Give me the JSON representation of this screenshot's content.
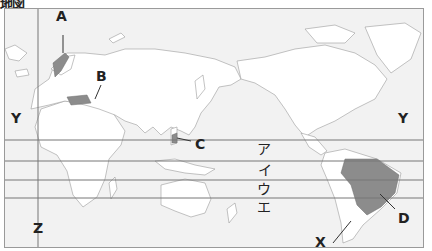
{
  "title": "地図",
  "map": {
    "background_color": "#f2f2f2",
    "land_color": "#ffffff",
    "highlight_color": "#8c8c8c",
    "line_color": "#777777",
    "markers": [
      {
        "id": "A",
        "label": "A",
        "target": "Norway"
      },
      {
        "id": "B",
        "label": "B",
        "target": "Turkey"
      },
      {
        "id": "C",
        "label": "C",
        "target": "Philippines"
      },
      {
        "id": "D",
        "label": "D",
        "target": "Brazil"
      },
      {
        "id": "X",
        "label": "X",
        "target": "Andes / Chile"
      }
    ],
    "meridian": {
      "label": "Z"
    },
    "side_labels": {
      "left": "Y",
      "right": "Y"
    },
    "latitude_lines": [
      {
        "label": "ア"
      },
      {
        "label": "イ"
      },
      {
        "label": "ウ"
      },
      {
        "label": "エ"
      }
    ]
  }
}
